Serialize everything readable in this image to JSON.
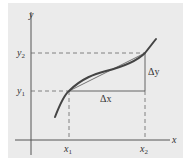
{
  "figure": {
    "background": "#ebebeb",
    "axes": {
      "x_label": "x",
      "y_label": "y"
    },
    "points": {
      "x1": {
        "base": "x",
        "sub": "1"
      },
      "x2": {
        "base": "x",
        "sub": "2"
      },
      "y1": {
        "base": "y",
        "sub": "1"
      },
      "y2": {
        "base": "y",
        "sub": "2"
      }
    },
    "increments": {
      "delta_x": "Δx",
      "delta_y": "Δy"
    },
    "colors": {
      "curve": "#444444",
      "secant": "#666666",
      "axis": "#555555",
      "dashed": "#666666"
    }
  }
}
